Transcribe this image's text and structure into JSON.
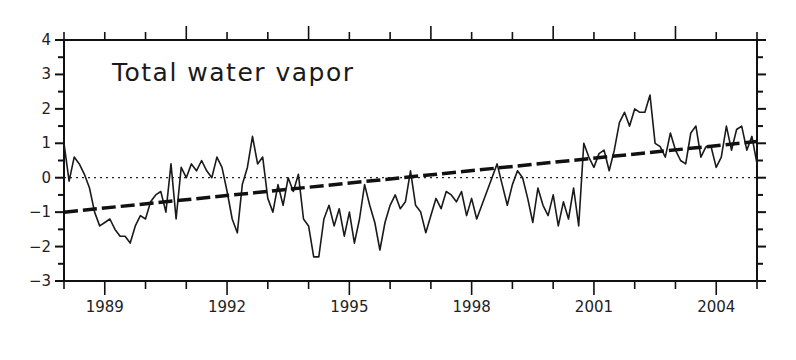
{
  "chart_data": {
    "type": "line",
    "title": "Total water vapor",
    "xlabel": "",
    "ylabel": "",
    "xlim": [
      1988.0,
      2005.0
    ],
    "ylim": [
      -3,
      4
    ],
    "x_tick_labels": [
      "1989",
      "1992",
      "1995",
      "1998",
      "2001",
      "2004"
    ],
    "x_ticks": [
      1989,
      1992,
      1995,
      1998,
      2001,
      2004
    ],
    "y_tick_labels": [
      "-3",
      "-2",
      "-1",
      "0",
      "1",
      "2",
      "3",
      "4"
    ],
    "y_ticks": [
      -3,
      -2,
      -1,
      0,
      1,
      2,
      3,
      4
    ],
    "grid": false,
    "zero_line": {
      "style": "dotted",
      "value": 0
    },
    "series": [
      {
        "name": "Total water vapor anomaly",
        "style": "solid",
        "x_start": 1988.0,
        "x_step": 0.125,
        "values": [
          1.0,
          -0.1,
          0.6,
          0.4,
          0.1,
          -0.3,
          -1.0,
          -1.4,
          -1.3,
          -1.2,
          -1.5,
          -1.7,
          -1.7,
          -1.9,
          -1.4,
          -1.1,
          -1.2,
          -0.7,
          -0.5,
          -0.4,
          -1.0,
          0.4,
          -1.2,
          0.3,
          0.0,
          0.4,
          0.2,
          0.5,
          0.2,
          0.0,
          0.6,
          0.3,
          -0.4,
          -1.2,
          -1.6,
          -0.2,
          0.3,
          1.2,
          0.4,
          0.6,
          -0.6,
          -1.0,
          -0.2,
          -0.8,
          0.0,
          -0.4,
          0.1,
          -1.2,
          -1.4,
          -2.3,
          -2.3,
          -1.2,
          -0.8,
          -1.4,
          -0.9,
          -1.7,
          -1.0,
          -1.9,
          -1.2,
          -0.2,
          -0.8,
          -1.3,
          -2.1,
          -1.3,
          -0.8,
          -0.5,
          -0.9,
          -0.7,
          0.2,
          -0.8,
          -1.0,
          -1.6,
          -1.1,
          -0.6,
          -0.9,
          -0.4,
          -0.5,
          -0.7,
          -0.4,
          -1.1,
          -0.6,
          -1.2,
          -0.8,
          -0.4,
          0.0,
          0.4,
          -0.2,
          -0.8,
          -0.2,
          0.2,
          0.0,
          -0.6,
          -1.3,
          -0.3,
          -0.8,
          -1.1,
          -0.5,
          -1.4,
          -0.7,
          -1.2,
          -0.3,
          -1.4,
          1.0,
          1.6,
          1.3,
          2.0,
          1.9,
          2.3,
          2.1,
          2.4,
          2.4,
          3.2,
          2.7,
          1.8,
          2.8,
          1.9,
          1.5,
          1.0,
          -0.2,
          0.9,
          -0.5,
          0.7,
          -0.8,
          -1.2,
          -0.7,
          -0.3,
          -0.4,
          -0.9,
          -0.7,
          -0.5,
          -0.8,
          -0.6,
          -0.3,
          -0.6,
          0.0,
          -0.5,
          0.5
        ]
      },
      {
        "name": "Linear trend",
        "style": "dashed",
        "x": [
          1988.0,
          2005.0
        ],
        "values": [
          -1.0,
          1.05
        ]
      }
    ],
    "series_continued": {
      "name": "Total water vapor anomaly (2001-2005)",
      "x_start": 2000.875,
      "x_step": 0.125,
      "values": [
        0.6,
        0.3,
        0.7,
        0.8,
        0.2,
        0.8,
        1.6,
        1.9,
        1.5,
        2.0,
        1.9,
        1.9,
        2.4,
        1.0,
        0.9,
        0.6,
        1.3,
        0.8,
        0.5,
        0.4,
        1.3,
        1.5,
        0.6,
        0.9,
        0.9,
        0.3,
        0.6,
        1.5,
        0.8,
        1.4,
        1.5,
        0.8,
        1.2,
        0.4,
        -0.5,
        0.5,
        0.7,
        0.4,
        0.9
      ]
    }
  }
}
